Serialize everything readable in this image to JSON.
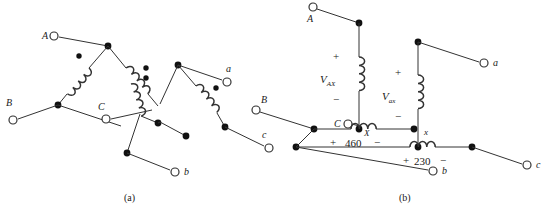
{
  "figure": {
    "captions": [
      {
        "id": "cap-a",
        "text": "(a)"
      },
      {
        "id": "cap-b",
        "text": "(b)"
      }
    ],
    "panel_a": {
      "name": "delta-delta-winding-diagram",
      "terminals": [
        {
          "id": "A",
          "label": "A"
        },
        {
          "id": "B",
          "label": "B"
        },
        {
          "id": "C",
          "label": "C"
        },
        {
          "id": "a",
          "label": "a"
        },
        {
          "id": "b",
          "label": "b"
        },
        {
          "id": "c",
          "label": "c"
        }
      ],
      "coil_count": 6,
      "polarity_dot_count": 6
    },
    "panel_b": {
      "name": "schematic-connection-diagram",
      "terminals": [
        {
          "id": "A",
          "label": "A"
        },
        {
          "id": "B",
          "label": "B"
        },
        {
          "id": "C",
          "label": "C"
        },
        {
          "id": "a",
          "label": "a"
        },
        {
          "id": "b",
          "label": "b"
        },
        {
          "id": "c",
          "label": "c"
        }
      ],
      "neutral_marks": [
        {
          "id": "X-upper",
          "label": "X"
        },
        {
          "id": "x-lower",
          "label": "x"
        }
      ],
      "voltages": [
        {
          "id": "V_AX",
          "base": "V",
          "subscript": "AX",
          "plus": "+",
          "minus": "−"
        },
        {
          "id": "V_ax",
          "base": "V",
          "subscript": "ax",
          "plus": "+",
          "minus": "−"
        },
        {
          "id": "V_460",
          "value": "460",
          "plus": "+",
          "minus": "−"
        },
        {
          "id": "V_230",
          "value": "230",
          "plus": "+",
          "minus": "−"
        }
      ]
    },
    "colors": {
      "line": "#333333",
      "node": "#111111",
      "text": "#1a1a1a",
      "background": "#ffffff"
    }
  }
}
